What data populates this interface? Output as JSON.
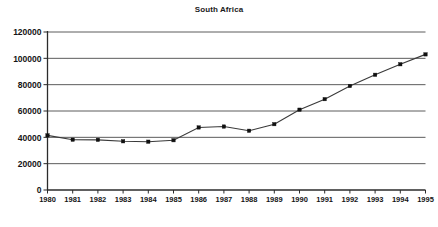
{
  "chart_data": {
    "type": "line",
    "title": "South Africa",
    "xlabel": "",
    "ylabel": "",
    "x": [
      1980,
      1981,
      1982,
      1983,
      1984,
      1985,
      1986,
      1987,
      1988,
      1989,
      1990,
      1991,
      1992,
      1993,
      1994,
      1995
    ],
    "categories": [
      "1980",
      "1981",
      "1982",
      "1983",
      "1984",
      "1985",
      "1986",
      "1987",
      "1988",
      "1989",
      "1990",
      "1991",
      "1992",
      "1993",
      "1994",
      "1995"
    ],
    "values": [
      41500,
      38200,
      38100,
      37000,
      36700,
      37800,
      47500,
      48200,
      45000,
      50000,
      61000,
      69000,
      79000,
      87500,
      95500,
      103000
    ],
    "series": [
      {
        "name": "South Africa",
        "values": [
          41500,
          38200,
          38100,
          37000,
          36700,
          37800,
          47500,
          48200,
          45000,
          50000,
          61000,
          69000,
          79000,
          87500,
          95500,
          103000
        ]
      }
    ],
    "ylim": [
      0,
      120000
    ],
    "yticks": [
      0,
      20000,
      40000,
      60000,
      80000,
      100000,
      120000
    ],
    "ytick_labels": [
      "0",
      "20000",
      "40000",
      "60000",
      "80000",
      "100000",
      "120000"
    ],
    "grid": true,
    "grid_axis": "y",
    "legend": false,
    "legend_position": "none",
    "marker": "square",
    "line_color": "#3a3a3a",
    "marker_color": "#111111",
    "grid_color": "#4a4a4a",
    "background_color": "#ffffff"
  }
}
